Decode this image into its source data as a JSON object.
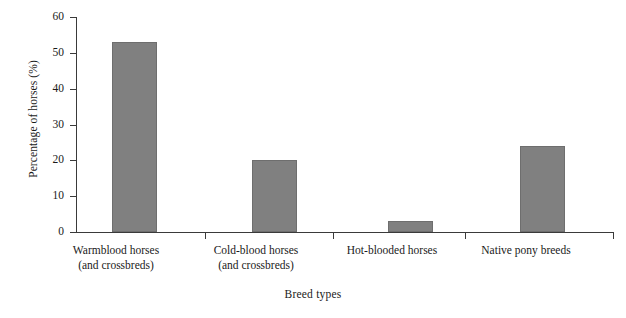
{
  "chart_data": {
    "type": "bar",
    "title": "",
    "categories": [
      "Warmblood horses (and crossbreds)",
      "Cold-blood horses (and crossbreds)",
      "Hot-blooded horses",
      "Native pony breeds"
    ],
    "category_lines": [
      [
        "Warmblood horses",
        "(and crossbreds)"
      ],
      [
        "Cold-blood horses",
        "(and crossbreds)"
      ],
      [
        "Hot-blooded horses",
        ""
      ],
      [
        "Native pony breeds",
        ""
      ]
    ],
    "values": [
      53,
      20,
      3,
      24
    ],
    "xlabel": "Breed types",
    "ylabel": "Percentage of horses (%)",
    "ylim": [
      0,
      60
    ],
    "yticks": [
      0,
      10,
      20,
      30,
      40,
      50,
      60
    ],
    "ytick_labels": [
      "0",
      "10",
      "20",
      "30",
      "40",
      "50",
      "60"
    ],
    "grid": false,
    "legend": "none",
    "bar_color": "#808080",
    "bar_edge_color": "#6e6e6e",
    "axis_color": "#3a3a3a"
  }
}
